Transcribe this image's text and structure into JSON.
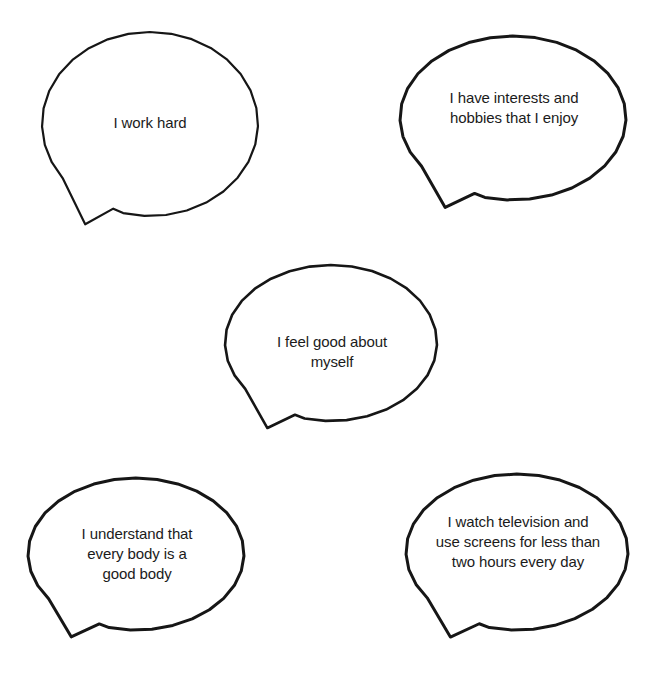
{
  "figure": {
    "kind": "speech-bubble-diagram",
    "background_color": "#ffffff",
    "stroke_color": "#161616",
    "text_color": "#1b1b1b",
    "bubble_count": 5
  },
  "bubbles": [
    {
      "id": "bubble-work-hard",
      "text": "I work hard",
      "lines": [
        "I work hard"
      ],
      "position": "top-left",
      "cx": 150,
      "cy": 124,
      "rx": 108,
      "ry": 92,
      "stroke_width": 2.2,
      "text_x": 62,
      "text_y": 113,
      "text_w": 176,
      "font_size": 15
    },
    {
      "id": "bubble-interests-hobbies",
      "text": "I have interests and hobbies that I enjoy",
      "lines": [
        "I have interests and",
        "hobbies that I enjoy"
      ],
      "position": "top-right",
      "cx": 513,
      "cy": 118,
      "rx": 113,
      "ry": 82,
      "stroke_width": 3.0,
      "text_x": 420,
      "text_y": 88,
      "text_w": 188,
      "font_size": 15
    },
    {
      "id": "bubble-feel-good",
      "text": "I feel good about myself",
      "lines": [
        "I feel good about",
        "myself"
      ],
      "position": "center",
      "cx": 331,
      "cy": 343,
      "rx": 106,
      "ry": 78,
      "stroke_width": 2.6,
      "text_x": 243,
      "text_y": 332,
      "text_w": 178,
      "font_size": 15
    },
    {
      "id": "bubble-good-body",
      "text": "I understand that every body is a good body",
      "lines": [
        "I understand that",
        "every body is a",
        "good body"
      ],
      "position": "bottom-left",
      "cx": 136,
      "cy": 554,
      "rx": 108,
      "ry": 76,
      "stroke_width": 3.0,
      "text_x": 48,
      "text_y": 524,
      "text_w": 178,
      "font_size": 15
    },
    {
      "id": "bubble-screen-time",
      "text": "I watch television and use screens for less than two hours every day",
      "lines": [
        "I watch television and",
        "use screens for less than",
        "two hours every day"
      ],
      "position": "bottom-right",
      "cx": 517,
      "cy": 552,
      "rx": 111,
      "ry": 78,
      "stroke_width": 3.0,
      "text_x": 412,
      "text_y": 512,
      "text_w": 212,
      "font_size": 15
    }
  ]
}
